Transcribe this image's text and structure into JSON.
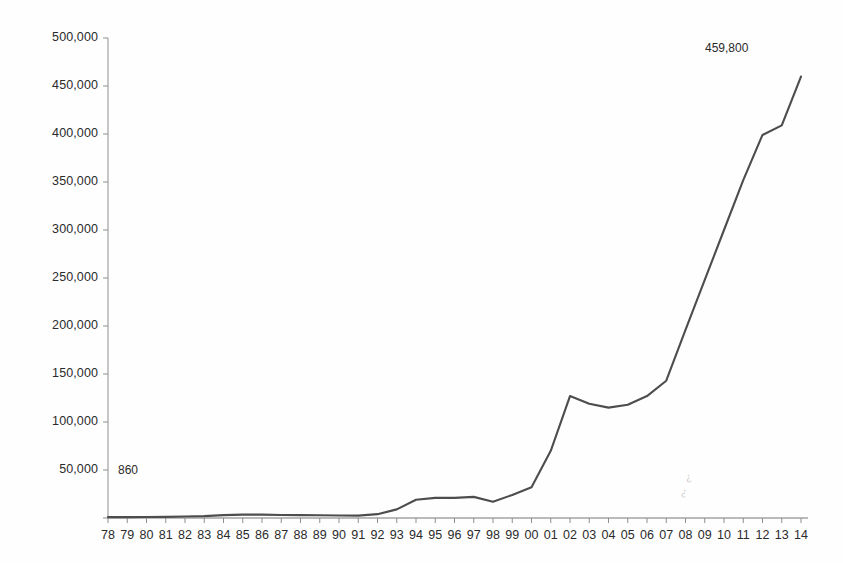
{
  "chart_data": {
    "type": "line",
    "title": "",
    "subtitle": "",
    "xlabel": "",
    "ylabel": "",
    "categories": [
      "78",
      "79",
      "80",
      "81",
      "82",
      "83",
      "84",
      "85",
      "86",
      "87",
      "88",
      "89",
      "90",
      "91",
      "92",
      "93",
      "94",
      "95",
      "96",
      "97",
      "98",
      "99",
      "00",
      "01",
      "02",
      "03",
      "04",
      "05",
      "06",
      "07",
      "08",
      "09",
      "10",
      "11",
      "12",
      "13",
      "14"
    ],
    "values": [
      860,
      900,
      1000,
      1200,
      1500,
      2000,
      3000,
      3500,
      3500,
      3200,
      3000,
      2800,
      2600,
      2500,
      4000,
      9000,
      19000,
      21000,
      21000,
      22000,
      17000,
      24000,
      32000,
      70000,
      127000,
      119000,
      115000,
      118000,
      127000,
      143000,
      196000,
      248000,
      300000,
      352000,
      399000,
      409000,
      459800
    ],
    "series": [
      {
        "name": "Series 1",
        "values": [
          860,
          900,
          1000,
          1200,
          1500,
          2000,
          3000,
          3500,
          3500,
          3200,
          3000,
          2800,
          2600,
          2500,
          4000,
          9000,
          19000,
          21000,
          21000,
          22000,
          17000,
          24000,
          32000,
          70000,
          127000,
          119000,
          115000,
          118000,
          127000,
          143000,
          196000,
          248000,
          300000,
          352000,
          399000,
          409000,
          459800
        ],
        "color": "#4d4d4d"
      }
    ],
    "ylim": [
      0,
      500000
    ],
    "ytick_labels": [
      "500,000",
      "450,000",
      "400,000",
      "350,000",
      "300,000",
      "250,000",
      "200,000",
      "150,000",
      "100,000",
      "50,000",
      ""
    ],
    "ytick_values": [
      500000,
      450000,
      400000,
      350000,
      300000,
      250000,
      200000,
      150000,
      100000,
      50000,
      0
    ],
    "grid": false,
    "legend": "none",
    "annotations": [
      {
        "label": "860",
        "category": "78",
        "value": 860,
        "position": "above-right"
      },
      {
        "label": "459,800",
        "category": "14",
        "value": 459800,
        "position": "above-left"
      }
    ]
  },
  "axes": {
    "y_axis_color": "#8a8a8a",
    "x_axis_color": "#6e6e6e",
    "tick_color": "#8a8a8a"
  },
  "colors": {
    "line": "#4d4d4d",
    "text": "#2b2b2b",
    "background": "#fefefe"
  },
  "artifacts": {
    "scan_smudge": "¿"
  }
}
